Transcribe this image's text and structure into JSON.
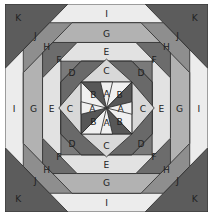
{
  "diagram": {
    "colors": {
      "K": "#5c5c5c",
      "J": "#8e8e8e",
      "I": "#ececec",
      "H": "#6c6c6c",
      "G": "#b2b2b2",
      "F": "#7a7a7a",
      "E": "#e2e2e2",
      "D": "#696969",
      "C": "#d8d8d8",
      "B": "#575757",
      "A": "#f0f0f0",
      "outline": "#2a2a2a"
    },
    "labels": {
      "K": "K",
      "J": "J",
      "I": "I",
      "H": "H",
      "G": "G",
      "F": "F",
      "E": "E",
      "D": "D",
      "C": "C",
      "B": "B",
      "A": "A"
    }
  }
}
